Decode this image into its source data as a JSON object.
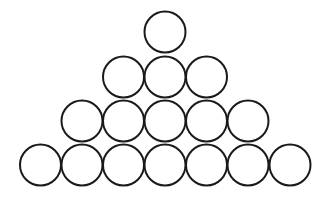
{
  "diagram": {
    "title": "",
    "style": {
      "stroke": "#1a1a1a",
      "fill": "#ffffff",
      "stroke_width": 2,
      "background": "#ffffff"
    },
    "radius": 20.5,
    "rows": [
      {
        "count": 1,
        "cy": 32,
        "cx": [
          165
        ]
      },
      {
        "count": 3,
        "cy": 77,
        "cx": [
          123.5,
          165,
          206.5
        ]
      },
      {
        "count": 5,
        "cy": 121,
        "cx": [
          82,
          123.5,
          165,
          206.5,
          248
        ]
      },
      {
        "count": 7,
        "cy": 165,
        "cx": [
          40.5,
          82,
          123.5,
          165,
          206.5,
          248,
          290
        ]
      }
    ],
    "total_circles": 16
  }
}
